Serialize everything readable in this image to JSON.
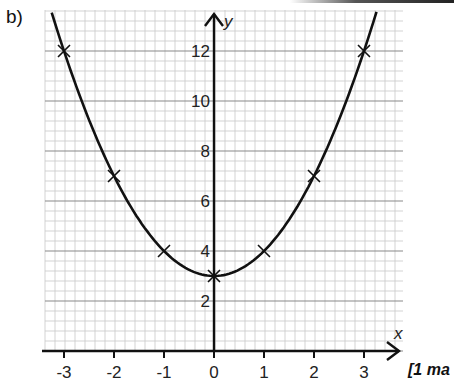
{
  "question": {
    "label": "b)",
    "marks": "[1 ma"
  },
  "chart_data": {
    "type": "line",
    "title": "",
    "xlabel": "x",
    "ylabel": "y",
    "xlim": [
      -3.4,
      3.8
    ],
    "ylim": [
      0,
      13.6
    ],
    "grid": true,
    "x_ticks": [
      -3,
      -2,
      -1,
      0,
      1,
      2,
      3
    ],
    "y_ticks": [
      2,
      4,
      6,
      8,
      10,
      12
    ],
    "series": [
      {
        "name": "y = x^2 + 3",
        "x": [
          -3,
          -2,
          -1,
          0,
          1,
          2,
          3
        ],
        "values": [
          12,
          7,
          4,
          3,
          4,
          7,
          12
        ],
        "marker": "x",
        "curve": "smooth"
      }
    ]
  }
}
